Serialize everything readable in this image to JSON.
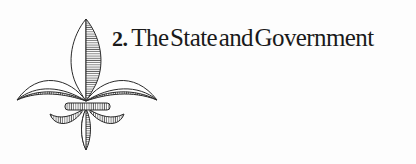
{
  "chapter": {
    "number": "2.",
    "title": "The State and Government"
  },
  "ornament": {
    "icon": "fleur-de-lis-icon",
    "stroke_color": "#2a2a2a",
    "hatch_color": "#555555"
  }
}
